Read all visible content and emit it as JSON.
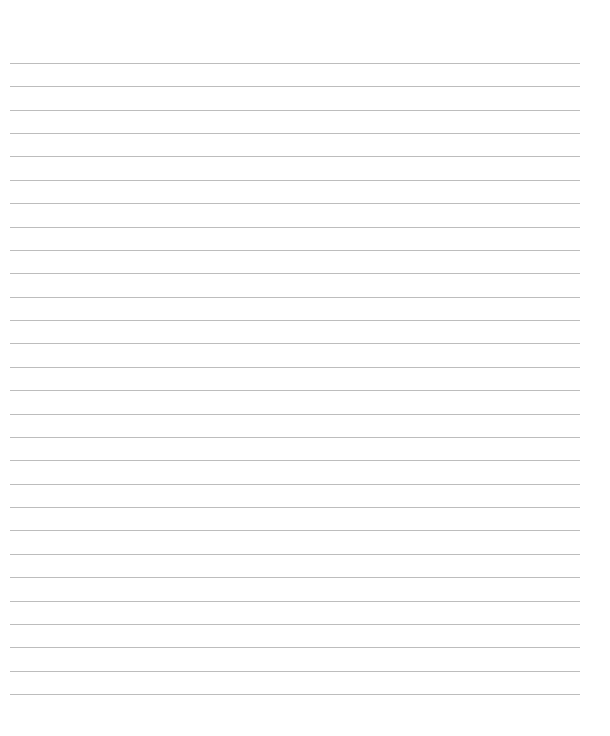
{
  "page": {
    "type": "lined-paper",
    "background_color": "#ffffff",
    "line_color": "#bdbdbd",
    "line_count": 28,
    "first_line_y": 63,
    "line_spacing": 23.37,
    "line_left_x": 10,
    "line_right_x": 580,
    "text": ""
  }
}
